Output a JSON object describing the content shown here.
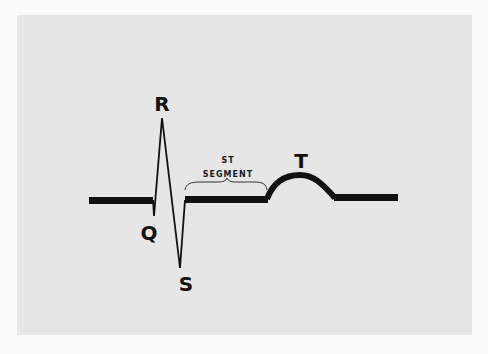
{
  "diagram": {
    "background_color": "#e6e6e6",
    "line_color": "#111111",
    "labels": {
      "r": "R",
      "q": "Q",
      "s": "S",
      "t": "T",
      "st_line1": "ST",
      "st_line2": "SEGMENT"
    },
    "features": [
      {
        "id": "Q",
        "description": "small downward deflection before R"
      },
      {
        "id": "R",
        "description": "tall upward spike"
      },
      {
        "id": "S",
        "description": "deep downward deflection after R"
      },
      {
        "id": "ST segment",
        "description": "flat baseline between S and T, marked with a brace"
      },
      {
        "id": "T",
        "description": "rounded upward wave"
      }
    ]
  }
}
